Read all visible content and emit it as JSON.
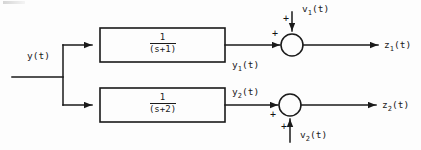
{
  "diagram": {
    "type": "control-block-diagram",
    "stroke_color": "#1a1a1a",
    "background_color": "#fdfdfd",
    "input": {
      "label": "y(t)"
    },
    "branches": [
      {
        "id": "upper",
        "block": {
          "numerator": "1",
          "denominator": "(s+1)"
        },
        "block_output_label": "y",
        "block_output_sub": "1",
        "block_output_suffix": "(t)",
        "summer": {
          "sign_main": "+",
          "sign_disturbance": "+",
          "disturbance_label": "v",
          "disturbance_sub": "1",
          "disturbance_suffix": "(t)",
          "disturbance_from": "top"
        },
        "output_label": "z",
        "output_sub": "1",
        "output_suffix": "(t)"
      },
      {
        "id": "lower",
        "block": {
          "numerator": "1",
          "denominator": "(s+2)"
        },
        "block_output_label": "y",
        "block_output_sub": "2",
        "block_output_suffix": "(t)",
        "summer": {
          "sign_main": "+",
          "sign_disturbance": "+",
          "disturbance_label": "v",
          "disturbance_sub": "2",
          "disturbance_suffix": "(t)",
          "disturbance_from": "bottom"
        },
        "output_label": "z",
        "output_sub": "2",
        "output_suffix": "(t)"
      }
    ]
  }
}
